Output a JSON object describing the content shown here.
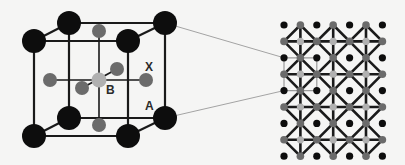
{
  "figure": {
    "labels": {
      "x_site": "X",
      "b_site": "B",
      "a_site": "A"
    },
    "colors": {
      "background": "#f5f5f4",
      "a_atom": "#0d0d0d",
      "x_atom": "#6b6b6b",
      "b_atom": "#b0b0b0",
      "bond": "#1a1a1a",
      "leader_line": "#9a9a9a"
    },
    "unit_cell": {
      "front_face": {
        "tl": [
          34,
          41
        ],
        "tr": [
          128,
          41
        ],
        "bl": [
          34,
          136
        ],
        "br": [
          128,
          136
        ]
      },
      "back_face": {
        "tl": [
          69,
          23
        ],
        "tr": [
          165,
          23
        ],
        "bl": [
          69,
          118
        ],
        "br": [
          165,
          118
        ]
      },
      "b_center": [
        99,
        80
      ],
      "x_atoms": [
        [
          99,
          31
        ],
        [
          99,
          125
        ],
        [
          50,
          80
        ],
        [
          146,
          80
        ],
        [
          82,
          88
        ],
        [
          117,
          69
        ]
      ]
    },
    "lattice": {
      "origin": [
        284,
        25
      ],
      "pitch": 16.4,
      "cols": 7,
      "rows": 9
    }
  }
}
